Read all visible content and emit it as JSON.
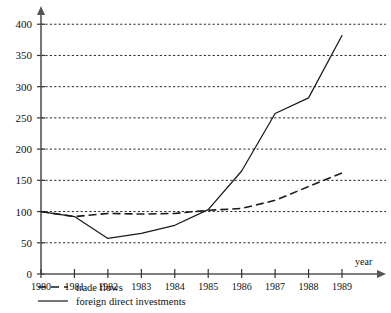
{
  "chart_data": {
    "type": "line",
    "title": "",
    "xlabel": "year",
    "ylabel": "",
    "categories": [
      "1980",
      "1981",
      "1982",
      "1983",
      "1984",
      "1985",
      "1986",
      "1987",
      "1988",
      "1989"
    ],
    "x": [
      1980,
      1981,
      1982,
      1983,
      1984,
      1985,
      1986,
      1987,
      1988,
      1989
    ],
    "xlim": [
      1980,
      1989
    ],
    "ylim": [
      0,
      410
    ],
    "yticks": [
      0,
      50,
      100,
      150,
      200,
      250,
      300,
      350,
      400
    ],
    "ytick_labels": [
      "0",
      "50",
      "100",
      "150",
      "200",
      "250",
      "300",
      "350",
      "400"
    ],
    "grid": true,
    "grid_axis": "y",
    "grid_style": "dashed",
    "legend_position": "below-axis-left",
    "series": [
      {
        "name": "trade flows",
        "style": "dashed",
        "color": "#1a1a1a",
        "values": [
          100,
          92,
          97,
          96,
          97,
          102,
          105,
          118,
          140,
          162
        ]
      },
      {
        "name": "foreign direct investments",
        "style": "solid",
        "color": "#1a1a1a",
        "values": [
          100,
          92,
          57,
          65,
          78,
          103,
          165,
          257,
          282,
          382
        ]
      }
    ]
  },
  "axes": {
    "x_axis_name": "year",
    "y_axis_name": ""
  },
  "legend": {
    "items": [
      {
        "label": "trade flows",
        "style": "dashed"
      },
      {
        "label": "foreign direct investments",
        "style": "solid"
      }
    ]
  }
}
